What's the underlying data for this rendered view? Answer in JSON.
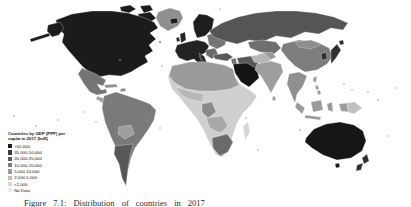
{
  "figure": {
    "caption": "Figure 7.1: Distribution of countries in 2017"
  },
  "legend": {
    "title_line1": "Countries by GDP (PPP) per",
    "title_line2": "capita in 2017 (Int$)",
    "items": [
      {
        "label": ">50,000",
        "color": "#1a1a1a"
      },
      {
        "label": "35,000-50,000",
        "color": "#3c3c3c"
      },
      {
        "label": "20,000-35,000",
        "color": "#5a5a5a"
      },
      {
        "label": "10,000-20,000",
        "color": "#7a7a7a"
      },
      {
        "label": "5,000-10,000",
        "color": "#9c9c9c"
      },
      {
        "label": "2,000-5,000",
        "color": "#bcbcbc"
      },
      {
        "label": "<2,000",
        "color": "#d9d9d9"
      },
      {
        "label": "No Data",
        "color": "#ebebeb"
      }
    ]
  },
  "regions": {
    "canada_usa": {
      "label": "Canada & United States",
      "category": ">50,000",
      "color": "#1b1b1b"
    },
    "alaska": {
      "label": "Alaska",
      "category": ">50,000",
      "color": "#1b1b1b"
    },
    "arctic_islands": {
      "label": "Arctic islands",
      "category": ">50,000",
      "color": "#1b1b1b"
    },
    "greenland": {
      "label": "Greenland",
      "category": "10,000-20,000",
      "color": "#8f8f8f"
    },
    "mexico": {
      "label": "Mexico",
      "category": "10,000-20,000",
      "color": "#757575"
    },
    "central_america": {
      "label": "Central America",
      "category": "5,000-10,000",
      "color": "#a5a5a5"
    },
    "caribbean": {
      "label": "Caribbean",
      "category": "10,000-20,000",
      "color": "#8f8f8f"
    },
    "south_america": {
      "label": "South America (north)",
      "category": "10,000-20,000",
      "color": "#7a7a7a"
    },
    "bolivia_paraguay": {
      "label": "Bolivia & Paraguay",
      "category": "5,000-10,000",
      "color": "#9e9e9e"
    },
    "argentina_chile": {
      "label": "Argentina & Chile",
      "category": "20,000-35,000",
      "color": "#585858"
    },
    "iceland": {
      "label": "Iceland",
      "category": ">50,000",
      "color": "#1e1e1e"
    },
    "uk_ireland": {
      "label": "UK & Ireland",
      "category": "35,000-50,000",
      "color": "#242424"
    },
    "scandinavia": {
      "label": "Scandinavia",
      "category": ">50,000",
      "color": "#1e1e1e"
    },
    "western_europe": {
      "label": "Western Europe",
      "category": ">50,000",
      "color": "#222222"
    },
    "eastern_europe": {
      "label": "Eastern Europe",
      "category": "10,000-20,000",
      "color": "#757575"
    },
    "balkans": {
      "label": "Balkans",
      "category": "20,000-35,000",
      "color": "#6a6a6a"
    },
    "russia": {
      "label": "Russia",
      "category": "20,000-35,000",
      "color": "#555555"
    },
    "kazakhstan": {
      "label": "Kazakhstan",
      "category": "20,000-35,000",
      "color": "#6f6f6f"
    },
    "central_asia": {
      "label": "Central Asia",
      "category": "5,000-10,000",
      "color": "#9a9a9a"
    },
    "turkey": {
      "label": "Turkey",
      "category": "20,000-35,000",
      "color": "#585858"
    },
    "levant": {
      "label": "Levant",
      "category": "10,000-20,000",
      "color": "#757575"
    },
    "saudi_gulf": {
      "label": "Saudi Arabia & Gulf",
      "category": ">50,000",
      "color": "#141414"
    },
    "iran": {
      "label": "Iran",
      "category": "20,000-35,000",
      "color": "#585858"
    },
    "north_africa": {
      "label": "North Africa",
      "category": "10,000-20,000",
      "color": "#9a9a9a"
    },
    "sub_saharan": {
      "label": "Sub-Saharan Africa",
      "category": "<2,000",
      "color": "#cfcfcf"
    },
    "west_africa": {
      "label": "West Africa coast",
      "category": "2,000-5,000",
      "color": "#b8b8b8"
    },
    "gabon_congo": {
      "label": "Gabon & Congo",
      "category": "10,000-20,000",
      "color": "#8a8a8a"
    },
    "angola_zambia": {
      "label": "Angola & Zambia",
      "category": "5,000-10,000",
      "color": "#a8a8a8"
    },
    "south_africa": {
      "label": "Southern Africa",
      "category": "10,000-20,000",
      "color": "#6a6a6a"
    },
    "madagascar": {
      "label": "Madagascar",
      "category": "<2,000",
      "color": "#d6d6d6"
    },
    "india": {
      "label": "India",
      "category": "5,000-10,000",
      "color": "#9e9e9e"
    },
    "pakistan_afghanistan": {
      "label": "Pakistan & Afghanistan",
      "category": "2,000-5,000",
      "color": "#b5b5b5"
    },
    "china": {
      "label": "China",
      "category": "10,000-20,000",
      "color": "#7d7d7d"
    },
    "mongolia": {
      "label": "Mongolia",
      "category": "10,000-20,000",
      "color": "#8d8d8d"
    },
    "indochina": {
      "label": "Indochina",
      "category": "5,000-10,000",
      "color": "#8f8f8f"
    },
    "korea": {
      "label": "South Korea",
      "category": "35,000-50,000",
      "color": "#303030"
    },
    "japan": {
      "label": "Japan",
      "category": "35,000-50,000",
      "color": "#303030"
    },
    "philippines": {
      "label": "Philippines",
      "category": "5,000-10,000",
      "color": "#9e9e9e"
    },
    "indonesia": {
      "label": "Indonesia",
      "category": "10,000-20,000",
      "color": "#9a9a9a"
    },
    "new_guinea": {
      "label": "New Guinea (east)",
      "category": "2,000-5,000",
      "color": "#c0c0c0"
    },
    "new_guinea_west": {
      "label": "New Guinea (west)",
      "category": "10,000-20,000",
      "color": "#9a9a9a"
    },
    "australia": {
      "label": "Australia",
      "category": ">50,000",
      "color": "#161616"
    },
    "new_zealand": {
      "label": "New Zealand",
      "category": "35,000-50,000",
      "color": "#303030"
    },
    "islands": {
      "label": "Small islands",
      "category": "No Data",
      "color": "#9f9f9f"
    }
  }
}
